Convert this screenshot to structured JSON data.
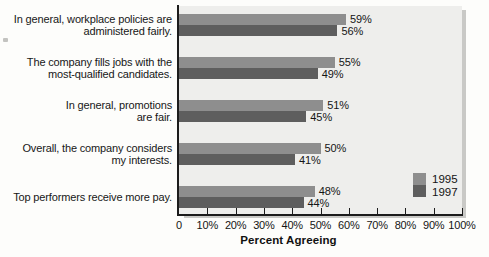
{
  "chart_data": {
    "type": "bar",
    "orientation": "horizontal",
    "title": "",
    "xlabel": "Percent Agreeing",
    "ylabel": "",
    "xlim": [
      0,
      100
    ],
    "grid": false,
    "legend_position": "inside-right",
    "categories": [
      "In general, workplace policies are administered fairly.",
      "The company fills jobs with the most-qualified candidates.",
      "In general, promotions are fair.",
      "Overall, the company considers my interests.",
      "Top performers receive more pay."
    ],
    "category_lines": [
      [
        "In general, workplace policies are",
        "administered fairly."
      ],
      [
        "The company fills jobs with the",
        "most-qualified candidates."
      ],
      [
        "In general, promotions",
        "are fair."
      ],
      [
        "Overall, the company considers",
        "my interests."
      ],
      [
        "Top performers receive more pay."
      ]
    ],
    "series": [
      {
        "name": "1995",
        "color": "#8e8e8e",
        "values": [
          59,
          55,
          51,
          50,
          48
        ],
        "labels": [
          "59%",
          "55%",
          "51%",
          "50%",
          "48%"
        ]
      },
      {
        "name": "1997",
        "color": "#5e5e5e",
        "values": [
          56,
          49,
          45,
          41,
          44
        ],
        "labels": [
          "56%",
          "49%",
          "45%",
          "41%",
          "44%"
        ]
      }
    ],
    "xticks": [
      0,
      10,
      20,
      30,
      40,
      50,
      60,
      70,
      80,
      90,
      100
    ],
    "xtick_labels": [
      "0",
      "10%",
      "20%",
      "30%",
      "40%",
      "50%",
      "60%",
      "70%",
      "80%",
      "90%",
      "100%"
    ]
  },
  "legend": {
    "entries": [
      {
        "label": "1995"
      },
      {
        "label": "1997"
      }
    ]
  },
  "axis": {
    "title": "Percent Agreeing"
  }
}
